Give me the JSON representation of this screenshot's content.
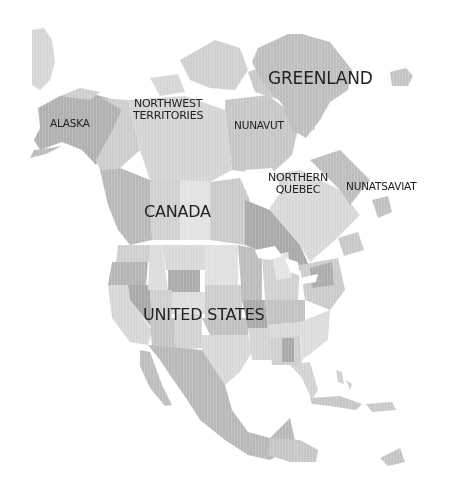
{
  "map": {
    "title": "North America",
    "labels": {
      "greenland": "GREENLAND",
      "alaska": "ALASKA",
      "northwest_territories_1": "NORTHWEST",
      "northwest_territories_2": "TERRITORIES",
      "nunavut": "NUNAVUT",
      "northern_quebec_1": "NORTHERN",
      "northern_quebec_2": "QUEBEC",
      "nunatsiavut": "NUNATSAVIAT",
      "canada": "CANADA",
      "united_states": "UNITED STATES"
    },
    "colors": {
      "background": "#ffffff",
      "land_light": "#dcdcdc",
      "land_mid": "#c4c4c4",
      "land_dark": "#a9a9a9",
      "label_text": "#222222"
    }
  }
}
